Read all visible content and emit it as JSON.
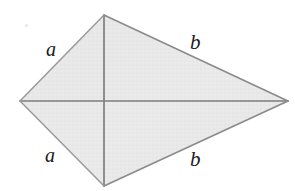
{
  "figure": {
    "background_color": "#ffffff",
    "fill_color": "#e8e8e8",
    "edge_color": "#8f8f8f",
    "diagonal_color": "#7e7e7e",
    "label_color": "#1a1a1a"
  },
  "labels": {
    "a_upper": "a",
    "a_lower": "a",
    "b_upper": "b",
    "b_lower": "b"
  },
  "chart_data": {
    "type": "diagram",
    "shape": "kite",
    "title": "",
    "vertices": [
      {
        "name": "top",
        "x": 104,
        "y": 15
      },
      {
        "name": "right",
        "x": 288,
        "y": 101
      },
      {
        "name": "bottom",
        "x": 104,
        "y": 186
      },
      {
        "name": "left",
        "x": 20,
        "y": 101
      }
    ],
    "edges": [
      {
        "from": "left",
        "to": "top",
        "label": "a"
      },
      {
        "from": "top",
        "to": "right",
        "label": "b"
      },
      {
        "from": "right",
        "to": "bottom",
        "label": "b"
      },
      {
        "from": "bottom",
        "to": "left",
        "label": "a"
      }
    ],
    "diagonals": [
      {
        "name": "horizontal",
        "from": "left",
        "to": "right"
      },
      {
        "name": "vertical",
        "from": "top",
        "to": "bottom"
      }
    ],
    "intersection": {
      "x": 104,
      "y": 101
    },
    "grid": false,
    "legend": "none"
  }
}
